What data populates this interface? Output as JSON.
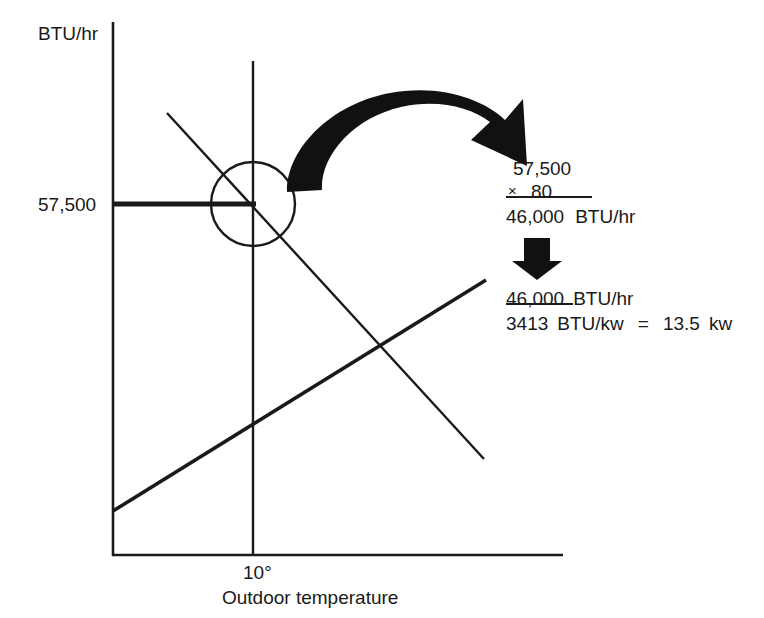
{
  "figure": {
    "type": "line-chart-annotated-diagram",
    "background_color": "#ffffff",
    "ink_color": "#1a1a1a"
  },
  "axes": {
    "y_axis_label": "BTU/hr",
    "x_axis_label": "Outdoor temperature",
    "y_tick_label": "57,500",
    "x_tick_label": "10°"
  },
  "chart_data": {
    "type": "line",
    "title": "",
    "xlabel": "Outdoor temperature",
    "ylabel": "BTU/hr",
    "grid": false,
    "legend": null,
    "annotations": [
      {
        "name": "intersection-circle",
        "text": "",
        "note": "circle highlighting the intersection of the heat-loss line and the 10° reference line"
      },
      {
        "name": "value-guide",
        "text": "57,500",
        "note": "horizontal guide line from the y-axis at 57,500 BTU/hr to the intersection point"
      },
      {
        "name": "temperature-guide",
        "text": "10°",
        "note": "vertical guide line at 10° outdoor temperature"
      }
    ],
    "series": [
      {
        "name": "heat-loss-line",
        "description": "descending line: building heat loss decreases as outdoor temperature rises",
        "x": [
          0.18,
          0.93
        ],
        "y_btu": [
          78000,
          15000
        ]
      },
      {
        "name": "heat-pump-capacity-line",
        "description": "ascending line: heat pump output capacity increases with outdoor temperature",
        "x": [
          0.0,
          0.94
        ],
        "y_btu": [
          9000,
          52000
        ]
      }
    ],
    "reference_point": {
      "x_label": "10°",
      "y_label": "57,500",
      "y_value": 57500,
      "units": "BTU/hr"
    }
  },
  "calculation": {
    "multiplication": {
      "operand_1": "57,500",
      "operator": "×",
      "operand_2": ".80",
      "result": "46,000",
      "result_units": "BTU/hr"
    },
    "division": {
      "numerator": "46,000",
      "numerator_units": "BTU/hr",
      "denominator": "3413",
      "denominator_units": "BTU/kw",
      "equals": "=",
      "result": "13.5",
      "result_units": "kw"
    }
  },
  "arrows": {
    "curved_arrow_label": "curved-arrow",
    "down_arrow_label": "down-arrow"
  }
}
